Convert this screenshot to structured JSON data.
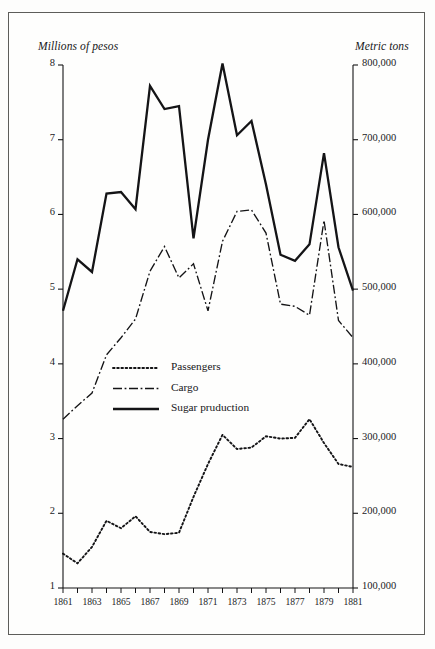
{
  "figure": {
    "background_color": "#fefefd",
    "frame_color": "#5d5d5a",
    "ink_color": "#141416"
  },
  "chart_data": {
    "type": "line",
    "title": "",
    "subtitle": "",
    "xlabel": "",
    "ylabel": "Millions of pesos",
    "y2label": "Metric tons",
    "grid": false,
    "legend_position": "center-left",
    "xlim": [
      1861,
      1881
    ],
    "ylim": [
      1,
      8
    ],
    "y2lim": [
      100000,
      800000
    ],
    "yticks": [
      1,
      2,
      3,
      4,
      5,
      6,
      7,
      8
    ],
    "ytick_labels": [
      "1",
      "2",
      "3",
      "4",
      "5",
      "6",
      "7",
      "8"
    ],
    "y2ticks": [
      100000,
      200000,
      300000,
      400000,
      500000,
      600000,
      700000,
      800000
    ],
    "y2tick_labels": [
      "100,000",
      "200,000",
      "300,000",
      "400,000",
      "500,000",
      "600,000",
      "700,000",
      "800,000"
    ],
    "x": [
      1861,
      1862,
      1863,
      1864,
      1865,
      1866,
      1867,
      1868,
      1869,
      1870,
      1871,
      1872,
      1873,
      1874,
      1875,
      1876,
      1877,
      1878,
      1879,
      1880,
      1881
    ],
    "xticks_minor": [
      1861,
      1862,
      1863,
      1864,
      1865,
      1866,
      1867,
      1868,
      1869,
      1870,
      1871,
      1872,
      1873,
      1874,
      1875,
      1876,
      1877,
      1878,
      1879,
      1880,
      1881
    ],
    "xtick_labels": [
      "1861",
      "1863",
      "1865",
      "1867",
      "1869",
      "1871",
      "1873",
      "1875",
      "1877",
      "1879",
      "1881"
    ],
    "xticks_labeled": [
      1861,
      1863,
      1865,
      1867,
      1869,
      1871,
      1873,
      1875,
      1877,
      1879,
      1881
    ],
    "series": [
      {
        "name": "Passengers",
        "legend_label": "Passengers",
        "style": "dotted",
        "axis": "left",
        "values": [
          1.46,
          1.33,
          1.55,
          1.9,
          1.8,
          1.96,
          1.75,
          1.72,
          1.74,
          2.22,
          2.66,
          3.05,
          2.86,
          2.88,
          3.03,
          3.0,
          3.01,
          3.26,
          2.94,
          2.66,
          2.62
        ]
      },
      {
        "name": "Cargo",
        "legend_label": "Cargo",
        "style": "dashdot",
        "axis": "left",
        "values": [
          3.26,
          3.44,
          3.61,
          4.12,
          4.35,
          4.6,
          5.24,
          5.57,
          5.15,
          5.34,
          4.71,
          5.64,
          6.04,
          6.06,
          5.75,
          4.8,
          4.77,
          4.65,
          5.92,
          4.58,
          4.35
        ]
      },
      {
        "name": "Sugar pruduction",
        "legend_label": "Sugar pruduction",
        "style": "solid",
        "axis": "right",
        "values_left_scale": [
          4.71,
          5.4,
          5.23,
          6.28,
          6.3,
          6.07,
          7.72,
          7.41,
          7.45,
          5.68,
          7.0,
          8.02,
          7.06,
          7.25,
          6.4,
          5.46,
          5.38,
          5.6,
          6.82,
          5.56,
          4.98
        ],
        "values": [
          471000,
          540000,
          523000,
          628000,
          630000,
          607000,
          772000,
          741000,
          745000,
          568000,
          700000,
          802000,
          706000,
          725000,
          640000,
          546000,
          538000,
          560000,
          682000,
          556000,
          498000
        ]
      }
    ]
  },
  "legend": {
    "items": [
      {
        "label": "Passengers",
        "style": "dotted"
      },
      {
        "label": "Cargo",
        "style": "dashdot"
      },
      {
        "label": "Sugar pruduction",
        "style": "solid"
      }
    ]
  }
}
